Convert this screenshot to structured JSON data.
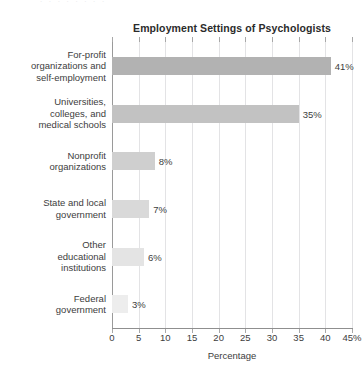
{
  "top_bleed_text": ". . . . . . . .",
  "chart_data": {
    "type": "bar",
    "orientation": "horizontal",
    "title": "Employment Settings of Psychologists",
    "xlabel": "Percentage",
    "ylabel": "",
    "xlim": [
      0,
      45
    ],
    "grid": true,
    "legend": "none",
    "categories": [
      "For-profit organizations and self-employment",
      "Universities, colleges, and medical schools",
      "Nonprofit organizations",
      "State and local government",
      "Other educational institutions",
      "Federal government"
    ],
    "category_lines": [
      [
        "For-profit",
        "organizations and",
        "self-employment"
      ],
      [
        "Universities,",
        "colleges, and",
        "medical schools"
      ],
      [
        "Nonprofit",
        "organizations"
      ],
      [
        "State and local",
        "government"
      ],
      [
        "Other",
        "educational",
        "institutions"
      ],
      [
        "Federal",
        "government"
      ]
    ],
    "values": [
      41,
      35,
      8,
      7,
      6,
      3
    ],
    "value_labels": [
      "41%",
      "35%",
      "8%",
      "7%",
      "6%",
      "3%"
    ],
    "bar_colors": [
      "#b2b2b2",
      "#c2c2c2",
      "#cfcfcf",
      "#d9d9d9",
      "#e4e4e4",
      "#ededed"
    ],
    "xticks": [
      0,
      5,
      10,
      15,
      20,
      25,
      30,
      35,
      40,
      45
    ],
    "xtick_labels": [
      "0",
      "5",
      "10",
      "15",
      "20",
      "25",
      "30",
      "35",
      "40",
      "45%"
    ],
    "gridline_color": "#e3e3e5",
    "axis_color": "#8f8f8f",
    "text_color": "#3d3d3d",
    "background": "#ffffff"
  }
}
